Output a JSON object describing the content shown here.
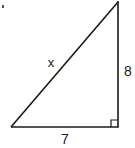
{
  "diagram": {
    "type": "right-triangle",
    "labels": {
      "hypotenuse": "x",
      "vertical_leg": "8",
      "horizontal_leg": "7"
    },
    "vertices": {
      "top": [
        118,
        2
      ],
      "bottom_left": [
        11,
        127
      ],
      "bottom_right": [
        118,
        127
      ]
    },
    "right_angle_marker": true,
    "stroke_color": "#1a1a1a",
    "background_color": "#ffffff"
  }
}
